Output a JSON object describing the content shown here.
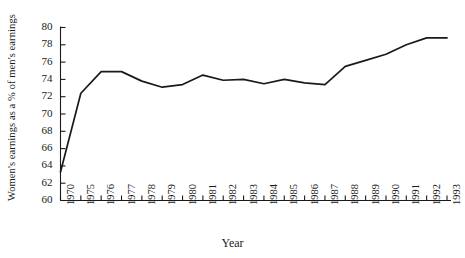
{
  "chart_data": {
    "type": "line",
    "title": "",
    "xlabel": "Year",
    "ylabel": "Women's earnings as a % of men's earnings",
    "xlim": [
      1970,
      1993
    ],
    "ylim": [
      60,
      80
    ],
    "grid": false,
    "legend": false,
    "y_ticks": [
      60,
      62,
      64,
      66,
      68,
      70,
      72,
      74,
      76,
      78,
      80
    ],
    "x_ticks": [
      1970,
      1975,
      1976,
      1977,
      1978,
      1979,
      1980,
      1981,
      1982,
      1983,
      1984,
      1985,
      1986,
      1987,
      1988,
      1989,
      1990,
      1991,
      1992,
      1993
    ],
    "x_tick_labels": [
      "1970",
      "1975",
      "1976",
      "1977",
      "1978",
      "1979",
      "1980",
      "1981",
      "1982",
      "1983",
      "1984",
      "1985",
      "1986",
      "1987",
      "1988",
      "1989",
      "1990",
      "1991",
      "1992",
      "1993"
    ],
    "line_color": "#1a1a1a",
    "x": [
      1970,
      1975,
      1976,
      1977,
      1978,
      1979,
      1980,
      1981,
      1982,
      1983,
      1984,
      1985,
      1986,
      1987,
      1988,
      1989,
      1990,
      1991,
      1992,
      1993
    ],
    "values": [
      63.3,
      72.4,
      74.9,
      74.9,
      73.8,
      73.1,
      73.4,
      74.5,
      73.9,
      74.0,
      73.5,
      74.0,
      73.6,
      73.4,
      75.5,
      76.2,
      76.9,
      78.0,
      78.8,
      78.8
    ],
    "series": [
      {
        "name": "Women's earnings as a % of men's earnings",
        "values": [
          63.3,
          72.4,
          74.9,
          74.9,
          73.8,
          73.1,
          73.4,
          74.5,
          73.9,
          74.0,
          73.5,
          74.0,
          73.6,
          73.4,
          75.5,
          76.2,
          76.9,
          78.0,
          78.8,
          78.8
        ]
      }
    ]
  }
}
